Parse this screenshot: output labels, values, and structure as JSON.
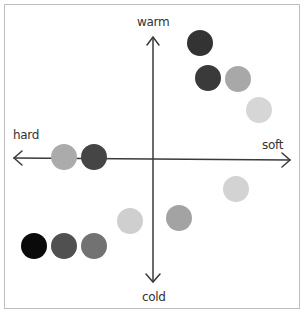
{
  "axes": {
    "top_label": "warm",
    "bottom_label": "cold",
    "left_label": "hard",
    "right_label": "soft",
    "color": "#3a3a3a"
  },
  "dots": [
    {
      "x": 200,
      "y": 43,
      "r": 13,
      "color": "#333333"
    },
    {
      "x": 208,
      "y": 78,
      "r": 13,
      "color": "#3a3a3a"
    },
    {
      "x": 238,
      "y": 79,
      "r": 13,
      "color": "#a8a8a8"
    },
    {
      "x": 259,
      "y": 110,
      "r": 13,
      "color": "#d6d6d6"
    },
    {
      "x": 64,
      "y": 157,
      "r": 13,
      "color": "#ababab"
    },
    {
      "x": 94,
      "y": 157,
      "r": 13,
      "color": "#454545"
    },
    {
      "x": 236,
      "y": 189,
      "r": 13,
      "color": "#d3d3d3"
    },
    {
      "x": 179,
      "y": 218,
      "r": 13,
      "color": "#a3a3a3"
    },
    {
      "x": 130,
      "y": 221,
      "r": 13,
      "color": "#cfcfcf"
    },
    {
      "x": 34,
      "y": 246,
      "r": 13,
      "color": "#0a0a0a"
    },
    {
      "x": 64,
      "y": 246,
      "r": 13,
      "color": "#505050"
    },
    {
      "x": 94,
      "y": 246,
      "r": 13,
      "color": "#727272"
    }
  ]
}
